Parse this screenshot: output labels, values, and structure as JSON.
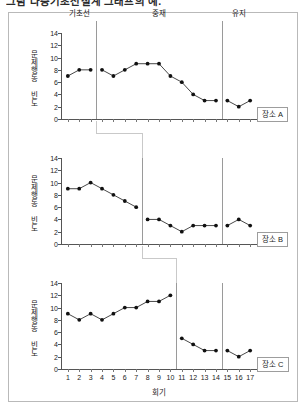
{
  "caption": "그림  다중기초선설계 그래프의 예.",
  "figure": {
    "x_axis_title": "회기",
    "y_axis_title": "문제행동 빈도",
    "y_ticks": [
      0,
      2,
      4,
      6,
      8,
      10,
      12,
      14
    ],
    "x_ticks": [
      1,
      2,
      3,
      4,
      5,
      6,
      7,
      8,
      9,
      10,
      11,
      12,
      13,
      14,
      15,
      16,
      17
    ],
    "phase_labels": {
      "baseline": "기초선",
      "intervention": "중재",
      "maintenance": "유지"
    }
  },
  "chart_data": [
    {
      "type": "line",
      "title": "장소 A",
      "legend_label": "장소 A",
      "xlabel": "회기",
      "ylabel": "문제행동 빈도",
      "ylim": [
        0,
        14
      ],
      "xlim": [
        1,
        17
      ],
      "grid": false,
      "legend_position": "bottom-right",
      "phase_boundaries": [
        3.5,
        14.5
      ],
      "phases": [
        {
          "name": "기초선",
          "x_range": [
            1,
            3
          ]
        },
        {
          "name": "중재",
          "x_range": [
            4,
            14
          ]
        },
        {
          "name": "유지",
          "x_range": [
            15,
            17
          ]
        }
      ],
      "x": [
        1,
        2,
        3,
        4,
        5,
        6,
        7,
        8,
        9,
        10,
        11,
        12,
        13,
        14,
        15,
        16,
        17
      ],
      "values": [
        7,
        8,
        8,
        8,
        7,
        8,
        9,
        9,
        9,
        7,
        6,
        4,
        3,
        3,
        3,
        2,
        3
      ],
      "segments": [
        {
          "phase": "기초선",
          "x": [
            1,
            2,
            3
          ],
          "values": [
            7,
            8,
            8
          ]
        },
        {
          "phase": "중재",
          "x": [
            4,
            5,
            6,
            7,
            8,
            9,
            10,
            11,
            12,
            13,
            14
          ],
          "values": [
            8,
            7,
            8,
            9,
            9,
            9,
            7,
            6,
            4,
            3,
            3
          ]
        },
        {
          "phase": "유지",
          "x": [
            15,
            16,
            17
          ],
          "values": [
            3,
            2,
            3
          ]
        }
      ]
    },
    {
      "type": "line",
      "title": "장소 B",
      "legend_label": "장소 B",
      "xlabel": "회기",
      "ylabel": "문제행동 빈도",
      "ylim": [
        0,
        14
      ],
      "xlim": [
        1,
        17
      ],
      "grid": false,
      "legend_position": "bottom-right",
      "phase_boundaries": [
        7.5,
        14.5
      ],
      "phases": [
        {
          "name": "기초선",
          "x_range": [
            1,
            7
          ]
        },
        {
          "name": "중재",
          "x_range": [
            8,
            14
          ]
        },
        {
          "name": "유지",
          "x_range": [
            15,
            17
          ]
        }
      ],
      "x": [
        1,
        2,
        3,
        4,
        5,
        6,
        7,
        8,
        9,
        10,
        11,
        12,
        13,
        14,
        15,
        16,
        17
      ],
      "values": [
        9,
        9,
        10,
        9,
        8,
        7,
        6,
        4,
        4,
        3,
        2,
        3,
        3,
        3,
        3,
        4,
        3
      ],
      "segments": [
        {
          "phase": "기초선",
          "x": [
            1,
            2,
            3,
            4,
            5,
            6,
            7
          ],
          "values": [
            9,
            9,
            10,
            9,
            8,
            7,
            6
          ]
        },
        {
          "phase": "중재",
          "x": [
            8,
            9,
            10,
            11,
            12,
            13,
            14
          ],
          "values": [
            4,
            4,
            3,
            2,
            3,
            3,
            3
          ]
        },
        {
          "phase": "유지",
          "x": [
            15,
            16,
            17
          ],
          "values": [
            3,
            4,
            3
          ]
        }
      ]
    },
    {
      "type": "line",
      "title": "장소 C",
      "legend_label": "장소 C",
      "xlabel": "회기",
      "ylabel": "문제행동 빈도",
      "ylim": [
        0,
        14
      ],
      "xlim": [
        1,
        17
      ],
      "grid": false,
      "legend_position": "bottom-right",
      "phase_boundaries": [
        10.5,
        14.5
      ],
      "phases": [
        {
          "name": "기초선",
          "x_range": [
            1,
            10
          ]
        },
        {
          "name": "중재",
          "x_range": [
            11,
            14
          ]
        },
        {
          "name": "유지",
          "x_range": [
            15,
            17
          ]
        }
      ],
      "x": [
        1,
        2,
        3,
        4,
        5,
        6,
        7,
        8,
        9,
        10,
        11,
        12,
        13,
        14,
        15,
        16,
        17
      ],
      "values": [
        9,
        8,
        9,
        8,
        9,
        10,
        10,
        11,
        11,
        12,
        5,
        4,
        3,
        3,
        3,
        2,
        3
      ],
      "segments": [
        {
          "phase": "기초선",
          "x": [
            1,
            2,
            3,
            4,
            5,
            6,
            7,
            8,
            9,
            10
          ],
          "values": [
            9,
            8,
            9,
            8,
            9,
            10,
            10,
            11,
            11,
            12
          ]
        },
        {
          "phase": "중재",
          "x": [
            11,
            12,
            13,
            14
          ],
          "values": [
            5,
            4,
            3,
            3
          ]
        },
        {
          "phase": "유지",
          "x": [
            15,
            16,
            17
          ],
          "values": [
            3,
            2,
            3
          ]
        }
      ]
    }
  ],
  "colors": {
    "line": "#333333",
    "marker": "#111111",
    "axis": "#555555",
    "phase_line": "#9a9a9a",
    "frame": "#b9b9b9"
  }
}
